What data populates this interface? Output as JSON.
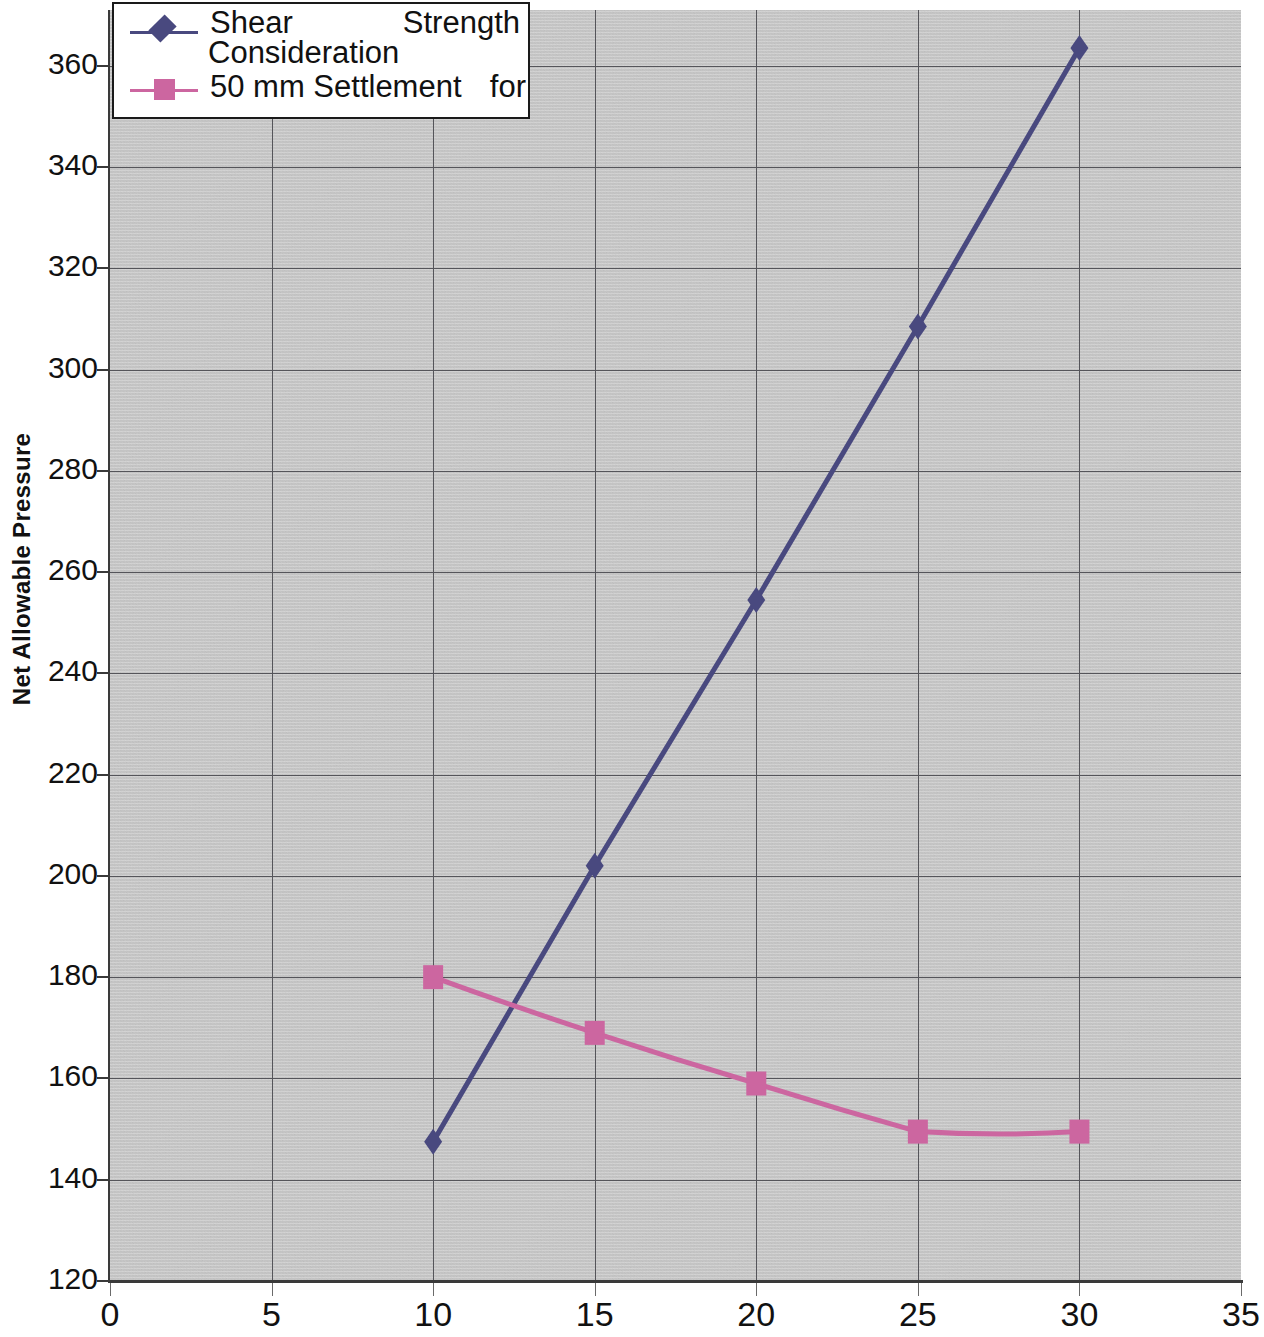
{
  "chart_data": {
    "type": "line",
    "title": "",
    "subtitle": "",
    "xlabel": "",
    "ylabel": "Net Allowable Pressure",
    "xlim": [
      0,
      35
    ],
    "ylim": [
      120,
      371
    ],
    "xticks": [
      0,
      5,
      10,
      15,
      20,
      25,
      30,
      35
    ],
    "xtick_labels": [
      "0",
      "5",
      "10",
      "15",
      "20",
      "25",
      "30",
      "35"
    ],
    "yticks": [
      120,
      140,
      160,
      180,
      200,
      220,
      240,
      260,
      280,
      300,
      320,
      340,
      360
    ],
    "ytick_labels": [
      "120",
      "140",
      "160",
      "180",
      "200",
      "220",
      "240",
      "260",
      "280",
      "300",
      "320",
      "340",
      "360"
    ],
    "grid": true,
    "grid_axes": "both",
    "legend_position": "top-left",
    "plot_background": "#c6c6c6",
    "series": [
      {
        "name": "Shear Strength Consideration",
        "legend_line1_left": "Shear",
        "legend_line1_right": "Strength",
        "legend_line2": "Consideration",
        "color": "#49497f",
        "marker": "diamond",
        "x": [
          10,
          15,
          20,
          25,
          30
        ],
        "values": [
          147.5,
          202,
          254.5,
          308.5,
          363.5
        ]
      },
      {
        "name": "50 mm Settlement for",
        "legend_line1_left": "50  mm  Settlement",
        "legend_line1_right": "for",
        "legend_line2": "",
        "color": "#cc66a0",
        "marker": "square",
        "x": [
          10,
          15,
          20,
          25,
          30
        ],
        "values": [
          180,
          169,
          159,
          149.5,
          149.5
        ]
      }
    ]
  },
  "axis": {
    "y_title": "Net Allowable Pressure"
  }
}
